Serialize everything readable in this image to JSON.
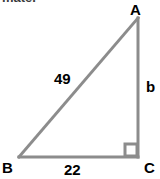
{
  "figure": {
    "type": "right-triangle-diagram",
    "clipped_prompt_text": "mate.",
    "stroke_color": "#8c8c8c",
    "text_color": "#000000",
    "background_color": "#ffffff",
    "stroke_width": 3
  },
  "vertices": {
    "a": {
      "label": "A",
      "x": 138,
      "y": 18
    },
    "b": {
      "label": "B",
      "x": 19,
      "y": 157
    },
    "c": {
      "label": "C",
      "x": 138,
      "y": 157
    }
  },
  "sides": {
    "hypotenuse": {
      "label": "49",
      "from": "B",
      "to": "A"
    },
    "vertical": {
      "label": "b",
      "from": "A",
      "to": "C"
    },
    "base": {
      "label": "22",
      "from": "B",
      "to": "C"
    }
  },
  "right_angle": {
    "at_vertex": "C",
    "marker": "square",
    "size": 12
  }
}
